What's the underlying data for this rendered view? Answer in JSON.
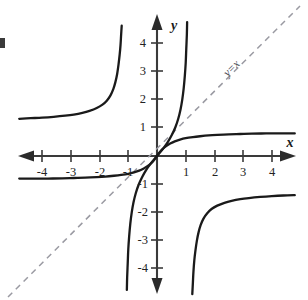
{
  "figure": {
    "title": "",
    "axis_labels": {
      "x": "x",
      "y": "y"
    },
    "line_label": "y=x",
    "colors": {
      "curve": "#1a1a1a",
      "axis": "#333333",
      "dashed_line": "#9a9aa2",
      "tick_label": "#222222",
      "background": "#ffffff"
    }
  },
  "chart_data": {
    "type": "line",
    "title": "",
    "xlabel": "x",
    "ylabel": "y",
    "xlim": [
      -4.8,
      4.8
    ],
    "ylim": [
      -4.9,
      4.7
    ],
    "grid": false,
    "legend": "none",
    "xticks": [
      -4,
      -3,
      -2,
      -1,
      1,
      2,
      3,
      4
    ],
    "xticklabels": [
      "-4",
      "-3",
      "-2",
      "-1",
      "1",
      "2",
      "3",
      "4"
    ],
    "yticks": [
      -4,
      -3,
      -2,
      -1,
      1,
      2,
      3,
      4
    ],
    "yticklabels": [
      "-4",
      "-3",
      "-2",
      "-1",
      "1",
      "2",
      "3",
      "4"
    ],
    "annotations": [
      {
        "text": "y=x",
        "x": 2.6,
        "y": 2.6,
        "rotation": -45,
        "style": "dashed-reference-line"
      }
    ],
    "series": [
      {
        "name": "tangent-like-steep-curve-upper-left-branch",
        "style": "solid",
        "points": [
          [
            -4.8,
            1.32
          ],
          [
            -4.4,
            1.34
          ],
          [
            -4.0,
            1.36
          ],
          [
            -3.6,
            1.39
          ],
          [
            -3.2,
            1.43
          ],
          [
            -2.9,
            1.47
          ],
          [
            -2.6,
            1.53
          ],
          [
            -2.35,
            1.6
          ],
          [
            -2.1,
            1.7
          ],
          [
            -1.9,
            1.82
          ],
          [
            -1.75,
            1.96
          ],
          [
            -1.62,
            2.15
          ],
          [
            -1.52,
            2.38
          ],
          [
            -1.45,
            2.62
          ],
          [
            -1.39,
            2.9
          ],
          [
            -1.34,
            3.25
          ],
          [
            -1.3,
            3.6
          ],
          [
            -1.27,
            3.95
          ],
          [
            -1.25,
            4.3
          ],
          [
            -1.23,
            4.62
          ]
        ]
      },
      {
        "name": "tangent-like-steep-curve-central-branch",
        "style": "solid",
        "points": [
          [
            -1.05,
            -4.75
          ],
          [
            -1.04,
            -4.3
          ],
          [
            -1.02,
            -3.8
          ],
          [
            -1.0,
            -3.3
          ],
          [
            -0.97,
            -2.85
          ],
          [
            -0.93,
            -2.4
          ],
          [
            -0.88,
            -2.0
          ],
          [
            -0.82,
            -1.65
          ],
          [
            -0.74,
            -1.32
          ],
          [
            -0.64,
            -1.02
          ],
          [
            -0.52,
            -0.75
          ],
          [
            -0.38,
            -0.5
          ],
          [
            -0.22,
            -0.27
          ],
          [
            0.0,
            0.0
          ],
          [
            0.22,
            0.27
          ],
          [
            0.38,
            0.5
          ],
          [
            0.52,
            0.75
          ],
          [
            0.64,
            1.02
          ],
          [
            0.74,
            1.32
          ],
          [
            0.82,
            1.65
          ],
          [
            0.88,
            2.0
          ],
          [
            0.93,
            2.4
          ],
          [
            0.97,
            2.85
          ],
          [
            1.0,
            3.3
          ],
          [
            1.02,
            3.8
          ],
          [
            1.04,
            4.3
          ],
          [
            1.05,
            4.75
          ]
        ]
      },
      {
        "name": "tangent-like-steep-curve-lower-right-branch",
        "style": "solid",
        "points": [
          [
            1.23,
            -4.9
          ],
          [
            1.25,
            -4.5
          ],
          [
            1.27,
            -4.1
          ],
          [
            1.3,
            -3.7
          ],
          [
            1.34,
            -3.35
          ],
          [
            1.39,
            -3.0
          ],
          [
            1.45,
            -2.7
          ],
          [
            1.52,
            -2.45
          ],
          [
            1.62,
            -2.22
          ],
          [
            1.75,
            -2.03
          ],
          [
            1.9,
            -1.88
          ],
          [
            2.1,
            -1.76
          ],
          [
            2.35,
            -1.66
          ],
          [
            2.6,
            -1.59
          ],
          [
            2.9,
            -1.53
          ],
          [
            3.2,
            -1.49
          ],
          [
            3.6,
            -1.45
          ],
          [
            4.0,
            -1.42
          ],
          [
            4.4,
            -1.4
          ],
          [
            4.8,
            -1.39
          ]
        ]
      },
      {
        "name": "arctangent-like-flat-curve",
        "style": "solid",
        "points": [
          [
            -4.8,
            -0.8
          ],
          [
            -4.3,
            -0.8
          ],
          [
            -3.8,
            -0.8
          ],
          [
            -3.3,
            -0.79
          ],
          [
            -2.9,
            -0.78
          ],
          [
            -2.5,
            -0.77
          ],
          [
            -2.1,
            -0.75
          ],
          [
            -1.8,
            -0.73
          ],
          [
            -1.5,
            -0.7
          ],
          [
            -1.25,
            -0.67
          ],
          [
            -1.0,
            -0.63
          ],
          [
            -0.8,
            -0.58
          ],
          [
            -0.62,
            -0.52
          ],
          [
            -0.46,
            -0.44
          ],
          [
            -0.32,
            -0.35
          ],
          [
            -0.2,
            -0.25
          ],
          [
            -0.1,
            -0.14
          ],
          [
            0.0,
            0.0
          ],
          [
            0.1,
            0.14
          ],
          [
            0.2,
            0.25
          ],
          [
            0.32,
            0.35
          ],
          [
            0.46,
            0.44
          ],
          [
            0.62,
            0.52
          ],
          [
            0.8,
            0.58
          ],
          [
            1.0,
            0.63
          ],
          [
            1.25,
            0.67
          ],
          [
            1.5,
            0.7
          ],
          [
            1.8,
            0.73
          ],
          [
            2.1,
            0.75
          ],
          [
            2.5,
            0.77
          ],
          [
            2.9,
            0.78
          ],
          [
            3.3,
            0.79
          ],
          [
            3.8,
            0.8
          ],
          [
            4.3,
            0.8
          ],
          [
            4.8,
            0.8
          ]
        ]
      },
      {
        "name": "reference-line-y-equals-x",
        "style": "dashed",
        "points": [
          [
            -4.9,
            -4.9
          ],
          [
            4.9,
            4.9
          ]
        ]
      }
    ]
  }
}
